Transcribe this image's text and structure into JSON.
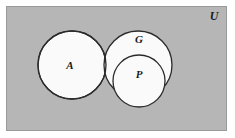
{
  "figure": {
    "name": "venn-diagram",
    "type": "set-diagram",
    "background_color": "#ffffff"
  },
  "universe": {
    "label": "U",
    "fill_color": "#b6b6b6",
    "stroke_color": "#8f8f8f",
    "rect": {
      "x": 6,
      "y": 6,
      "width": 221,
      "height": 125
    },
    "label_position": {
      "x": 214,
      "y": 17
    }
  },
  "sets": [
    {
      "label": "A",
      "name": "set-a",
      "cx": 72,
      "cy": 65,
      "r": 34,
      "fill_color": "#fafafa",
      "stroke_color": "#2b2b2b",
      "label_position": {
        "x": 70,
        "y": 66
      }
    },
    {
      "label": "G",
      "name": "set-g",
      "cx": 138,
      "cy": 65,
      "r": 34,
      "fill_color": "#fafafa",
      "stroke_color": "#2b2b2b",
      "label_position": {
        "x": 139,
        "y": 40
      }
    },
    {
      "label": "P",
      "name": "set-p",
      "cx": 139,
      "cy": 81,
      "r": 26,
      "fill_color": "#fafafa",
      "stroke_color": "#2b2b2b",
      "label_position": {
        "x": 139,
        "y": 75
      }
    }
  ],
  "relations": {
    "a_intersect_g": "overlapping",
    "p_subset_g": "nested"
  }
}
